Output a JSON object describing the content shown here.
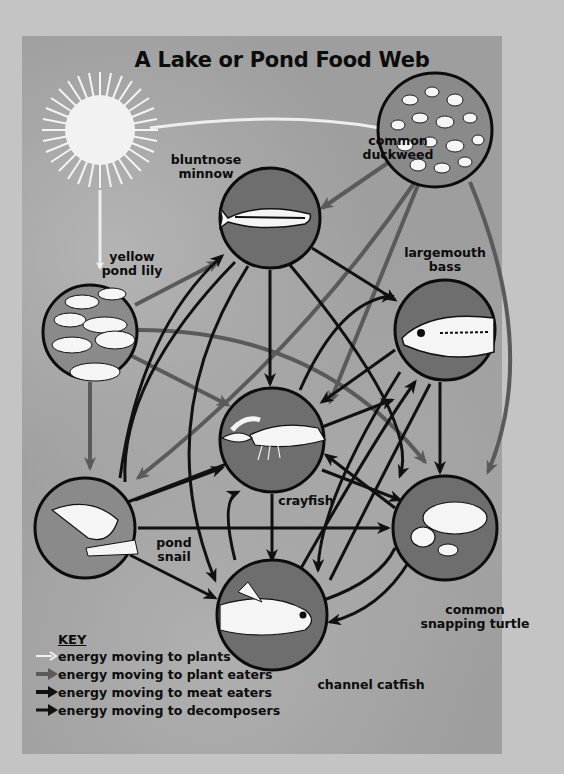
{
  "title": "A Lake or Pond Food Web",
  "organisms": {
    "sun": {
      "label": ""
    },
    "duckweed": {
      "label_line1": "common",
      "label_line2": "duckweed"
    },
    "minnow": {
      "label_line1": "bluntnose",
      "label_line2": "minnow"
    },
    "lily": {
      "label_line1": "yellow",
      "label_line2": "pond lily"
    },
    "bass": {
      "label_line1": "largemouth",
      "label_line2": "bass"
    },
    "crayfish": {
      "label": "crayfish"
    },
    "snail": {
      "label_line1": "pond",
      "label_line2": "snail"
    },
    "turtle": {
      "label_line1": "common",
      "label_line2": "snapping turtle"
    },
    "catfish": {
      "label": "channel catfish"
    }
  },
  "key": {
    "title": "KEY",
    "items": [
      {
        "label": "energy moving to plants",
        "color": "#f2f2f2"
      },
      {
        "label": "energy moving to plant eaters",
        "color": "#5a5a5a"
      },
      {
        "label": "energy moving to meat eaters",
        "color": "#111111"
      },
      {
        "label": "energy moving to decomposers",
        "color": "#111111"
      }
    ]
  },
  "colors": {
    "plants": "#f2f2f2",
    "plant_eaters": "#5a5a5a",
    "meat_eaters": "#111111",
    "circle_fill": "#6e6e6e",
    "background": "#9e9e9e"
  }
}
